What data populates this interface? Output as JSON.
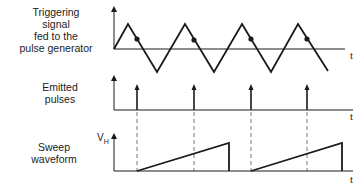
{
  "labels": {
    "trigger": [
      "Triggering",
      "signal",
      "fed to the",
      "pulse generator"
    ],
    "pulses": [
      "Emitted",
      "pulses"
    ],
    "sweep": [
      "Sweep",
      "waveform"
    ],
    "time_axis": "t",
    "sweep_axis": "V",
    "sweep_axis_sub": "H"
  },
  "colors": {
    "line": "#1a1a1a",
    "dashed": "#555555"
  },
  "waveforms": {
    "trigger": {
      "type": "triangle",
      "peaks_x": [
        128,
        185,
        242,
        298
      ],
      "valleys_x": [
        157,
        214,
        271
      ],
      "trigger_points_x": [
        137,
        194,
        251,
        307
      ]
    },
    "pulses": {
      "x": [
        137,
        194,
        251,
        307
      ]
    },
    "sweep": {
      "ramps": [
        [
          137,
          229
        ],
        [
          251,
          342
        ]
      ]
    }
  }
}
